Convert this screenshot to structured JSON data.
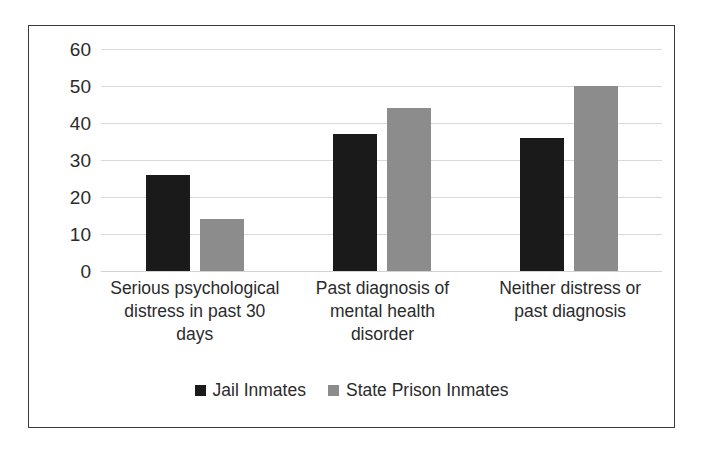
{
  "chart_data": {
    "type": "bar",
    "title": "",
    "subtitle": "",
    "xlabel": "",
    "ylabel": "",
    "ylim": [
      0,
      60
    ],
    "ytick_step": 10,
    "yticks": [
      60,
      50,
      40,
      30,
      20,
      10,
      0
    ],
    "grid": true,
    "legend_position": "bottom-center",
    "categories": [
      "Serious psychological distress in past 30 days",
      "Past diagnosis of mental health disorder",
      "Neither distress or past diagnosis"
    ],
    "category_label_lines": [
      [
        "Serious psychological",
        "distress in past 30",
        "days"
      ],
      [
        "Past diagnosis of",
        "mental health",
        "disorder"
      ],
      [
        "Neither distress or",
        "past diagnosis"
      ]
    ],
    "series": [
      {
        "name": "Jail Inmates",
        "color": "#1a1a1a",
        "values": [
          26,
          37,
          36
        ]
      },
      {
        "name": "State Prison Inmates",
        "color": "#8c8c8c",
        "values": [
          14,
          44,
          50
        ]
      }
    ]
  },
  "legend": {
    "items": [
      {
        "label": "Jail Inmates",
        "swatch": "legend-swatch-dark"
      },
      {
        "label": "State Prison Inmates",
        "swatch": "legend-swatch-gray"
      }
    ]
  },
  "style": {
    "border_color": "#3a3a3a",
    "gridline_color": "#d9d9d9",
    "text_color": "#2b2b2b",
    "background": "#ffffff"
  }
}
